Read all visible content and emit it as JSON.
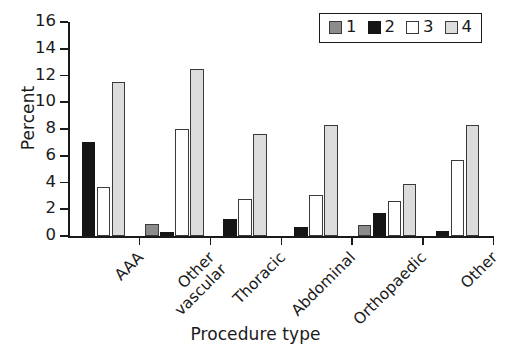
{
  "chart_data": {
    "type": "bar",
    "title": "",
    "xlabel": "Procedure type",
    "ylabel": "Percent",
    "categories": [
      "AAA",
      "Other vascular",
      "Thoracic",
      "Abdominal",
      "Orthopaedic",
      "Other"
    ],
    "category_lines": [
      [
        "AAA"
      ],
      [
        "Other",
        "vascular"
      ],
      [
        "Thoracic"
      ],
      [
        "Abdominal"
      ],
      [
        "Orthopaedic"
      ],
      [
        "Other"
      ]
    ],
    "series": [
      {
        "name": "1",
        "color": "#8c8c8c",
        "values": [
          null,
          0.9,
          null,
          null,
          0.8,
          null
        ]
      },
      {
        "name": "2",
        "color": "#151515",
        "values": [
          7.0,
          0.3,
          1.3,
          0.7,
          1.7,
          0.4
        ]
      },
      {
        "name": "3",
        "color": "#ffffff",
        "values": [
          3.7,
          8.0,
          2.8,
          3.1,
          2.6,
          5.7
        ]
      },
      {
        "name": "4",
        "color": "#dcdcdc",
        "values": [
          11.5,
          12.5,
          7.6,
          8.3,
          3.9,
          8.3
        ]
      }
    ],
    "ylim": [
      0,
      16
    ],
    "yticks": [
      0,
      2,
      4,
      6,
      8,
      10,
      12,
      14,
      16
    ],
    "ytick_labels": [
      "0",
      "2",
      "4",
      "6",
      "8",
      "10",
      "12",
      "14",
      "16"
    ],
    "grid": false,
    "legend_position": "top-right",
    "legend_entries": [
      "1",
      "2",
      "3",
      "4"
    ]
  }
}
